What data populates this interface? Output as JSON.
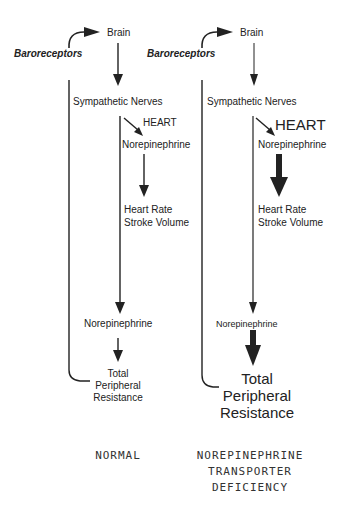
{
  "diagram": {
    "normal": {
      "baroreceptors": "Baroreceptors",
      "brain": "Brain",
      "sympathetic": "Sympathetic Nerves",
      "heart": "HEART",
      "ne_heart": "Norepinephrine",
      "hr_line1": "Heart Rate",
      "hr_line2": "Stroke Volume",
      "ne_vessel": "Norepinephrine",
      "tpr_line1": "Total",
      "tpr_line2": "Peripheral",
      "tpr_line3": "Resistance",
      "caption": "NORMAL"
    },
    "deficiency": {
      "baroreceptors": "Baroreceptors",
      "brain": "Brain",
      "sympathetic": "Sympathetic Nerves",
      "heart": "HEART",
      "ne_heart": "Norepinephrine",
      "hr_line1": "Heart Rate",
      "hr_line2": "Stroke Volume",
      "ne_vessel": "Norepinephrine",
      "tpr_line1": "Total",
      "tpr_line2": "Peripheral",
      "tpr_line3": "Resistance",
      "caption_line1": "NOREPINEPHRINE",
      "caption_line2": "TRANSPORTER",
      "caption_line3": "DEFICIENCY"
    }
  }
}
